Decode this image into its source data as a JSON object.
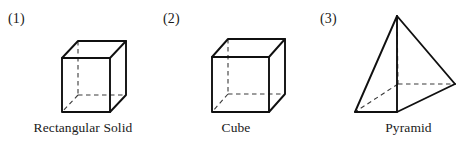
{
  "figure": {
    "background_color": "#ffffff",
    "edge_color": "#101010",
    "hidden_edge_color": "#3a3a3a"
  },
  "panels": [
    {
      "number": "(1)",
      "caption": "Rectangular Solid",
      "shape": "rectangular-solid"
    },
    {
      "number": "(2)",
      "caption": "Cube",
      "shape": "cube"
    },
    {
      "number": "(3)",
      "caption": "Pyramid",
      "shape": "square-pyramid"
    }
  ]
}
